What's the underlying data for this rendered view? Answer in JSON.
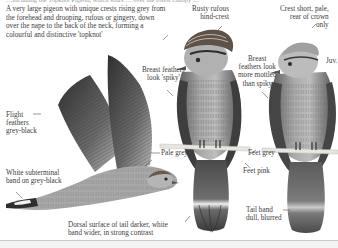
{
  "page": {
    "top_cut_text": "…including the Topknot Pigeon, which soars … over the forest canopy …",
    "intro": "A very large pigeon with unique crests rising grey from the forehead and drooping, rufous or gingery, down over the nape to the back of the neck, forming a colourful and distinctive 'topknot'"
  },
  "annotations": {
    "rusty_crest": "Rusty rufous hind-crest",
    "rusty_crest_l1": "Rusty rufous",
    "rusty_crest_l2": "hind-crest",
    "crest_short_l1": "Crest short, pale,",
    "crest_short_l2": "rear of crown",
    "crest_short_l3": "only",
    "breast_spiky_l1": "Breast feathers",
    "breast_spiky_l2": "look 'spiky'",
    "breast_mottled_l1": "Breast",
    "breast_mottled_l2": "feathers look",
    "breast_mottled_l3": "more mottled",
    "breast_mottled_l4": "than spiky",
    "juv": "Juv.",
    "flight_l1": "Flight",
    "flight_l2": "feathers",
    "flight_l3": "grey-black",
    "white_band_l1": "White subterminal",
    "white_band_l2": "band on grey-black",
    "pale_grey": "Pale grey",
    "feet_grey": "Feet grey",
    "feet_pink": "Feet pink",
    "tail_band_l1": "Tail band",
    "tail_band_l2": "dull, blurred",
    "dorsal_l1": "Dorsal surface of tail darker, white",
    "dorsal_l2": "band wider, in strong contrast"
  },
  "colors": {
    "ink": "#3c3c3c",
    "feather_dark": "#3a3a3a",
    "feather_mid": "#8a8a8a",
    "feather_light": "#c9c9c9",
    "perch": "#e9e6e0"
  },
  "figures": [
    {
      "name": "flying-adult",
      "pose": "in flight, dorsal view"
    },
    {
      "name": "perched-adult",
      "pose": "perched, front view"
    },
    {
      "name": "perched-juvenile",
      "pose": "perched, front view"
    }
  ]
}
